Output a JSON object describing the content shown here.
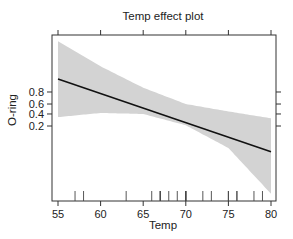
{
  "chart_data": {
    "type": "line",
    "title": "Temp effect plot",
    "xlabel": "Temp",
    "ylabel": "O-ring",
    "xlim": [
      54.5,
      80.5
    ],
    "ylim_logit": [
      -7.5,
      6.0
    ],
    "x_ticks": [
      55,
      60,
      65,
      70,
      75,
      80
    ],
    "y_ticks": [
      0.2,
      0.4,
      0.6,
      0.8
    ],
    "y_tick_labels": [
      "0.2",
      "0.4",
      "0.6",
      "0.8"
    ],
    "y_scale": "logit",
    "grid": false,
    "legend": "none",
    "fit": {
      "name": "fitted probability",
      "x": [
        55,
        80
      ],
      "y": [
        0.92,
        0.03
      ],
      "color": "#111111"
    },
    "confidence_band": {
      "x": [
        55,
        60,
        65,
        70,
        75,
        80
      ],
      "lower": [
        0.34,
        0.42,
        0.4,
        0.21,
        0.04,
        0.001
      ],
      "upper": [
        0.996,
        0.97,
        0.85,
        0.6,
        0.45,
        0.32
      ],
      "color": "#d3d3d3"
    },
    "rug": [
      57,
      58,
      63,
      66,
      67,
      67,
      67,
      68,
      69,
      70,
      70,
      70,
      70,
      72,
      73,
      75,
      75,
      76,
      76,
      78,
      79,
      81
    ]
  }
}
